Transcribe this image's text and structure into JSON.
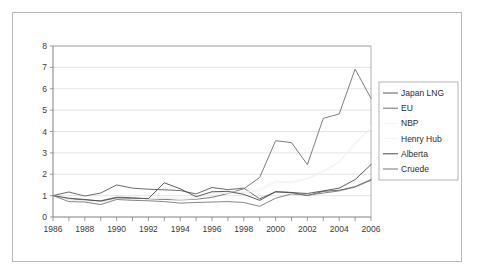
{
  "chart_data": {
    "type": "line",
    "title": "",
    "xlabel": "",
    "ylabel": "",
    "xlim": [
      1986,
      2006
    ],
    "ylim": [
      0,
      8
    ],
    "grid": true,
    "grid_axis": "y",
    "legend_position": "right",
    "x": [
      1986,
      1987,
      1988,
      1989,
      1990,
      1991,
      1992,
      1993,
      1994,
      1995,
      1996,
      1997,
      1998,
      1999,
      2000,
      2001,
      2002,
      2003,
      2004,
      2005,
      2006
    ],
    "xtick_labels": [
      "1986",
      "1988",
      "1990",
      "1992",
      "1994",
      "1996",
      "1998",
      "2000",
      "2002",
      "2004",
      "2006"
    ],
    "ytick_labels": [
      "0",
      "1",
      "2",
      "3",
      "4",
      "5",
      "6",
      "7",
      "8"
    ],
    "series": [
      {
        "name": "Japan LNG",
        "color": "#5a5a5a",
        "values": [
          1.0,
          1.17,
          0.98,
          1.12,
          1.5,
          1.35,
          1.3,
          1.27,
          1.24,
          1.08,
          1.38,
          1.28,
          1.35,
          0.85,
          1.18,
          1.15,
          1.0,
          1.2,
          1.25,
          1.42,
          1.75
        ]
      },
      {
        "name": "EU",
        "color": "#6e6e6e",
        "values": [
          1.0,
          0.84,
          0.8,
          0.76,
          0.93,
          0.9,
          0.85,
          0.82,
          0.8,
          0.83,
          0.92,
          1.1,
          1.32,
          1.85,
          3.57,
          3.48,
          2.45,
          4.62,
          4.82,
          6.92,
          5.55
        ]
      },
      {
        "name": "NBP",
        "color": "#efefef",
        "values": [
          1.0,
          0.8,
          0.72,
          0.6,
          0.88,
          0.82,
          0.85,
          0.88,
          0.82,
          0.86,
          1.08,
          1.12,
          1.15,
          1.22,
          1.62,
          1.6,
          1.78,
          2.1,
          2.55,
          3.4,
          4.15
        ]
      },
      {
        "name": "Henry Hub",
        "color": "#f2f2f2",
        "values": [
          1.0,
          0.82,
          0.74,
          0.7,
          0.86,
          0.84,
          0.88,
          0.92,
          0.9,
          0.9,
          1.12,
          1.16,
          1.18,
          1.3,
          1.7,
          1.66,
          1.82,
          2.18,
          2.6,
          3.48,
          4.2
        ]
      },
      {
        "name": "Alberta",
        "color": "#4a4a4a",
        "values": [
          1.0,
          0.88,
          0.82,
          0.74,
          0.9,
          0.88,
          0.86,
          1.6,
          1.32,
          0.95,
          1.18,
          1.2,
          1.06,
          0.78,
          1.18,
          1.14,
          1.1,
          1.22,
          1.35,
          1.75,
          2.45
        ]
      },
      {
        "name": "Cruede",
        "color": "#787878",
        "values": [
          1.0,
          0.72,
          0.7,
          0.58,
          0.82,
          0.78,
          0.76,
          0.72,
          0.65,
          0.68,
          0.7,
          0.72,
          0.68,
          0.5,
          0.88,
          1.08,
          1.02,
          1.12,
          1.22,
          1.4,
          1.72
        ]
      }
    ]
  },
  "legend": {
    "entries": [
      {
        "label": "Japan LNG",
        "swatch": true
      },
      {
        "label": "EU",
        "swatch": true
      },
      {
        "label": "NBP",
        "swatch": false
      },
      {
        "label": "Henry Hub",
        "swatch": false
      },
      {
        "label": "Alberta",
        "swatch": true
      },
      {
        "label": "Cruede",
        "swatch": true
      }
    ]
  },
  "colors": {
    "frame_border": "#b8b8b8",
    "grid": "#d9d9d9",
    "axis": "#808080",
    "text": "#3a3a3a",
    "background": "#ffffff"
  }
}
